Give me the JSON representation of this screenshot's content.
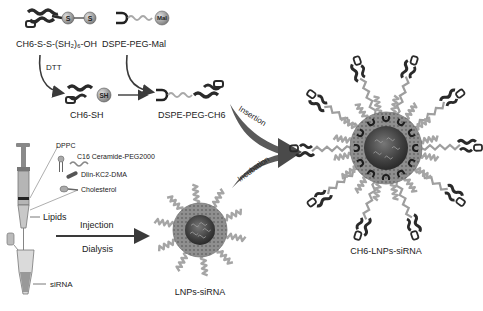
{
  "diagram": {
    "colors": {
      "ink": "#222222",
      "arrow_dark": "#3a3a3a",
      "arrow_mid": "#6e6e6e",
      "peg": "#a8a8a8",
      "shell": "#8c8c8c",
      "core": "#4a4a4a",
      "sulfur": "#9a9a9a",
      "mal": "#c8c8c8"
    },
    "top_synthesis": {
      "reactant_1": {
        "label": "CH6-S-S-(SH₂)₆-OH",
        "nodes": [
          "S",
          "S"
        ]
      },
      "reactant_2": {
        "label": "DSPE-PEG-Mal",
        "node": "Mal"
      },
      "reagent": "DTT",
      "intermediate": {
        "label": "CH6-SH",
        "node": "SH"
      },
      "product": {
        "label": "DSPE-PEG-CH6"
      }
    },
    "lipids": {
      "components": [
        "DPPC",
        "C16 Ceramide-PEG2000",
        "Dlin-KC2-DMA",
        "Cholesterol"
      ],
      "syringe_label": "Lipids",
      "tube_label": "siRNA"
    },
    "process": {
      "step_1_above": "Injection",
      "step_1_below": "Dialysis",
      "step_2_above": "Insertion",
      "step_2_below": "Incubation"
    },
    "nanoparticles": {
      "lnp": {
        "label": "LNPs-siRNA",
        "peg_chains": 10
      },
      "ch6_lnp": {
        "label": "CH6-LNPs-siRNA",
        "peg_chains": 16,
        "ch6_ligands": 10,
        "anchors": 12
      }
    }
  }
}
